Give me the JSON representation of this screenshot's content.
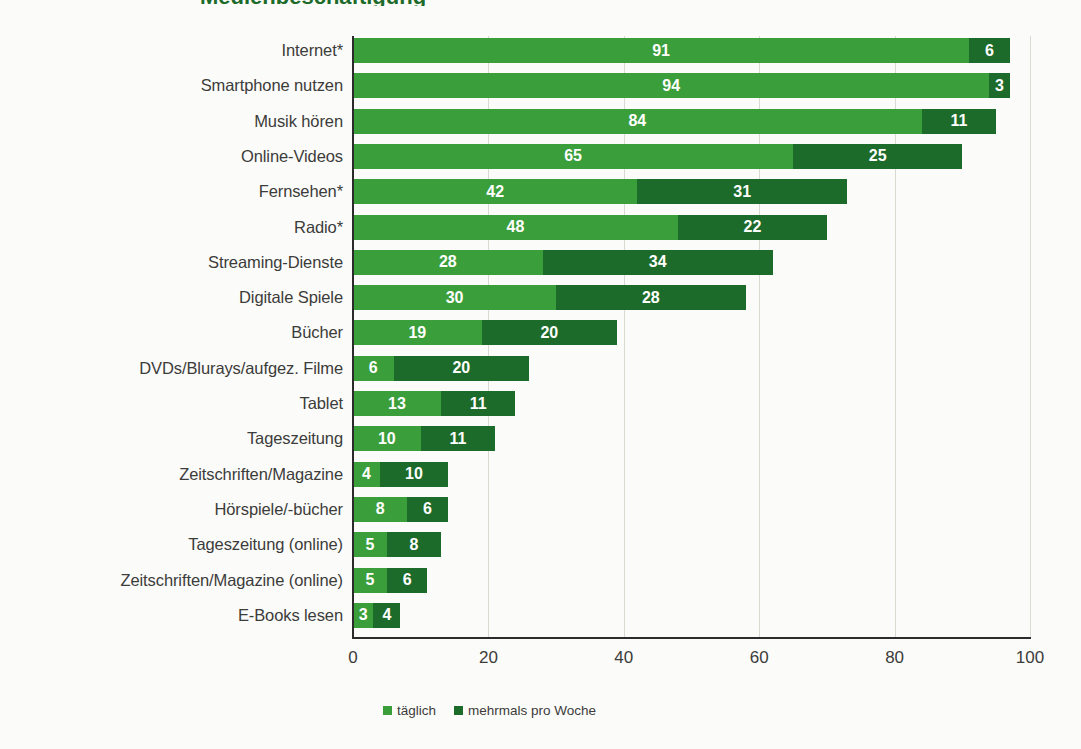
{
  "title_sliver": "Medienbeschäftigung",
  "legend": {
    "position": "bottom",
    "items": [
      {
        "label": "täglich",
        "color": "#3a9e3a",
        "key": "taeglich"
      },
      {
        "label": "mehrmals pro Woche",
        "color": "#1d6b2a",
        "key": "mehrmals"
      }
    ]
  },
  "axis": {
    "xlabel": "",
    "ylabel": "",
    "xticks": [
      "0",
      "20",
      "40",
      "60",
      "80",
      "100"
    ],
    "xlim": [
      0,
      100
    ]
  },
  "colors": {
    "series_taeglich": "#3a9e3a",
    "series_mehrmals": "#1d6b2a",
    "background": "#fbfbf9",
    "axis": "#2b2b2b",
    "grid": "#d9d9d2",
    "text": "#3c3c3b",
    "value_text": "#ffffff",
    "title": "#1d6b2a"
  },
  "chart_data": {
    "type": "bar",
    "orientation": "horizontal",
    "stacked": true,
    "title": "Medienbeschäftigung",
    "xlabel": "",
    "ylabel": "",
    "xlim": [
      0,
      100
    ],
    "grid": true,
    "legend_position": "bottom",
    "categories": [
      "Internet*",
      "Smartphone nutzen",
      "Musik hören",
      "Online-Videos",
      "Fernsehen*",
      "Radio*",
      "Streaming-Dienste",
      "Digitale Spiele",
      "Bücher",
      "DVDs/Blurays/aufgez. Filme",
      "Tablet",
      "Tageszeitung",
      "Zeitschriften/Magazine",
      "Hörspiele/-bücher",
      "Tageszeitung (online)",
      "Zeitschriften/Magazine (online)",
      "E-Books lesen"
    ],
    "series": [
      {
        "name": "täglich",
        "color": "#3a9e3a",
        "values": [
          91,
          94,
          84,
          65,
          42,
          48,
          28,
          30,
          19,
          6,
          13,
          10,
          4,
          8,
          5,
          5,
          3
        ]
      },
      {
        "name": "mehrmals pro Woche",
        "color": "#1d6b2a",
        "values": [
          6,
          3,
          11,
          25,
          31,
          22,
          34,
          28,
          20,
          20,
          11,
          11,
          10,
          6,
          8,
          6,
          4
        ]
      }
    ],
    "totals": [
      97,
      97,
      95,
      90,
      73,
      70,
      62,
      58,
      39,
      26,
      24,
      21,
      14,
      14,
      13,
      11,
      7
    ]
  }
}
